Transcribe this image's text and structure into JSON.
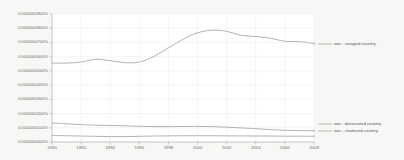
{
  "chart_data": {
    "type": "line",
    "title": "",
    "subtitle": "",
    "xlabel": "",
    "ylabel": "",
    "xlim": [
      1990,
      2008
    ],
    "ylim": [
      0,
      9e-09
    ],
    "grid": true,
    "legend_position": "right-of-line-end",
    "x_ticks": [
      "1990",
      "1992",
      "1994",
      "1996",
      "1998",
      "2000",
      "2002",
      "2004",
      "2006",
      "2008"
    ],
    "x_tick_values": [
      1990,
      1992,
      1994,
      1996,
      1998,
      2000,
      2002,
      2004,
      2006,
      2008
    ],
    "y_ticks": [
      "0.0000000000%",
      "0.0000000100%",
      "0.0000000200%",
      "0.0000000300%",
      "0.0000000400%",
      "0.0000000500%",
      "0.0000000600%",
      "0.0000000700%",
      "0.0000000800%",
      "0.0000000900%"
    ],
    "y_tick_values": [
      0,
      1e-09,
      2e-09,
      3e-09,
      4e-09,
      5e-09,
      6e-09,
      7e-09,
      8e-09,
      9e-09
    ],
    "x": [
      1990,
      1991,
      1992,
      1993,
      1994,
      1995,
      1996,
      1997,
      1998,
      1999,
      2000,
      2001,
      2002,
      2003,
      2004,
      2005,
      2006,
      2007,
      2008
    ],
    "series": [
      {
        "name": "war - ravaged country",
        "color": "#9a9a9a",
        "values": [
          5.55e-09,
          5.55e-09,
          5.62e-09,
          5.82e-09,
          5.72e-09,
          5.58e-09,
          5.62e-09,
          6.02e-09,
          6.62e-09,
          7.22e-09,
          7.68e-09,
          7.86e-09,
          7.78e-09,
          7.5e-09,
          7.42e-09,
          7.3e-09,
          7.08e-09,
          7.06e-09,
          6.92e-09
        ]
      },
      {
        "name": "war - devastated country",
        "color": "#9a9a9a",
        "values": [
          1.34e-09,
          1.28e-09,
          1.22e-09,
          1.18e-09,
          1.16e-09,
          1.14e-09,
          1.1e-09,
          1.08e-09,
          1.08e-09,
          1.09e-09,
          1.1e-09,
          1.08e-09,
          1.04e-09,
          9.9e-10,
          9.4e-10,
          8.7e-10,
          8.2e-10,
          8e-10,
          7.9e-10
        ]
      },
      {
        "name": "war - shattered country",
        "color": "#9a9a9a",
        "values": [
          4.6e-10,
          4.4e-10,
          4.2e-10,
          4e-10,
          3.8e-10,
          3.8e-10,
          4e-10,
          4.2e-10,
          4.3e-10,
          4.4e-10,
          4.4e-10,
          4.4e-10,
          4.3e-10,
          4.3e-10,
          4.2e-10,
          4.2e-10,
          4.1e-10,
          4.1e-10,
          4e-10
        ]
      }
    ],
    "legend": [
      {
        "label": "war - ravaged country",
        "y_px": 44
      },
      {
        "label": "war - devastated country",
        "y_px": 124
      },
      {
        "label": "war - shattered country",
        "y_px": 131
      }
    ]
  },
  "colors": {
    "background": "#f7f7f5",
    "plot_background": "#ffffff",
    "line": "#9a9a9a",
    "axis": "#b4b4b4",
    "grid": "#eaeaea",
    "tick_text": "#6d6d6d",
    "legend_text": "#555555"
  }
}
